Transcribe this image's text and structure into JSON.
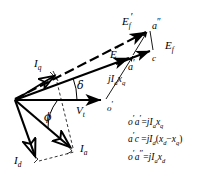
{
  "figure": {
    "type": "phasor-diagram",
    "background_color": "#ffffff",
    "stroke_color": "#000000"
  },
  "labels": {
    "ef_prime": {
      "base": "E",
      "sub": "f",
      "prime": "′"
    },
    "a_double_prime": {
      "base": "a",
      "prime": "″"
    },
    "e_prime": {
      "base": "E",
      "prime": "′"
    },
    "a_prime": {
      "base": "a",
      "prime": "′"
    },
    "c": {
      "base": "c"
    },
    "ef": {
      "base": "E",
      "sub": "f"
    },
    "iq": {
      "base": "I",
      "sub": "q"
    },
    "delta": {
      "base": "δ"
    },
    "phi": {
      "base": "ϕ"
    },
    "vt": {
      "base": "V",
      "sub": "t"
    },
    "o_prime": {
      "base": "o",
      "prime": "′"
    },
    "jiaxq": {
      "j": "j",
      "base": "I",
      "sub": "a",
      "x": "x",
      "xsub": "q"
    },
    "ia": {
      "base": "I",
      "sub": "a"
    },
    "id": {
      "base": "I",
      "sub": "d"
    }
  },
  "equations": [
    {
      "id": "eq-o-prime-a-prime",
      "lhs": {
        "p1": "o",
        "pr1": "′",
        "p2": "a",
        "pr2": "′"
      },
      "rel": "=",
      "rhs": "jIₐxₖ",
      "plain": "o'a' = jI_a x_q"
    },
    {
      "id": "eq-a-prime-c",
      "lhs": {
        "p1": "a",
        "pr1": "′",
        "p2": "c",
        "pr2": ""
      },
      "rel": "=",
      "rhs": "jI_d(x_d − x_q)",
      "plain": "a'c = jI_d(x_d - x_q)"
    },
    {
      "id": "eq-o-prime-a-double-prime",
      "lhs": {
        "p1": "o",
        "pr1": "′",
        "p2": "a",
        "pr2": "″"
      },
      "rel": "=",
      "rhs": "jI_a x_d",
      "plain": "o'a\" = jI_a x_d"
    }
  ],
  "eq_tokens": {
    "j": "j",
    "I": "I",
    "x": "x",
    "a": "a",
    "d": "d",
    "q": "q",
    "eq": "=",
    "minus": "−",
    "lparen": "(",
    "rparen": ")",
    "o": "o",
    "c": "c",
    "prime": "′",
    "dprime": "″"
  },
  "geometry": {
    "origin": {
      "x": 15,
      "y": 100
    },
    "points": {
      "o_prime": {
        "x": 105,
        "y": 100
      },
      "a_prime": {
        "x": 132,
        "y": 55
      },
      "a_double_prime": {
        "x": 150,
        "y": 29
      },
      "c": {
        "x": 152,
        "y": 52
      },
      "iq_tip": {
        "x": 57,
        "y": 73
      },
      "ia_tip": {
        "x": 74,
        "y": 150
      },
      "id_tip": {
        "x": 38,
        "y": 160
      },
      "vt_tip": {
        "x": 105,
        "y": 100
      }
    }
  }
}
